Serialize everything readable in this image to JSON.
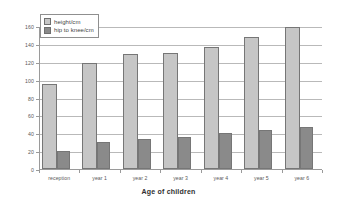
{
  "chart_data": {
    "type": "bar",
    "title": "",
    "xlabel": "Age of children",
    "ylabel": "",
    "categories": [
      "reception",
      "year 1",
      "year 2",
      "year 3",
      "year 4",
      "year 5",
      "year 6"
    ],
    "series": [
      {
        "name": "height/cm",
        "color": "#c6c6c6",
        "values": [
          95,
          119,
          129,
          130,
          136,
          148,
          158.5
        ]
      },
      {
        "name": "hip to knee/cm",
        "color": "#8a8a8a",
        "values": [
          20,
          30.5,
          34,
          36,
          40,
          43.5,
          47.5
        ]
      }
    ],
    "ylim": [
      0,
      160
    ],
    "yticks": [
      0,
      20,
      40,
      60,
      80,
      100,
      120,
      140,
      160
    ],
    "ytick_labels": [
      "0",
      "20",
      "40",
      "60",
      "80",
      "100",
      "120",
      "140",
      "160"
    ],
    "grid": true,
    "legend_position": "top-left"
  }
}
